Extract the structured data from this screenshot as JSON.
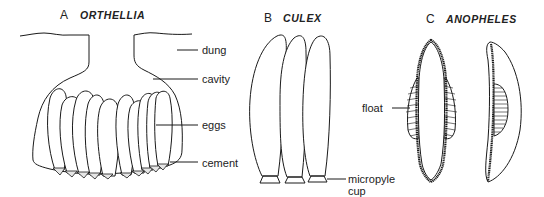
{
  "panels": [
    {
      "letter": "A",
      "genus": "ORTHELLIA",
      "labels": [
        "dung",
        "cavity",
        "eggs",
        "cement"
      ]
    },
    {
      "letter": "B",
      "genus": "CULEX",
      "labels": [
        "micropyle",
        "cup"
      ]
    },
    {
      "letter": "C",
      "genus": "ANOPHELES",
      "labels": [
        "float"
      ]
    }
  ],
  "colors": {
    "line": "#1a1a1a",
    "background": "#ffffff",
    "cement_fill": "#e6e6e6"
  }
}
